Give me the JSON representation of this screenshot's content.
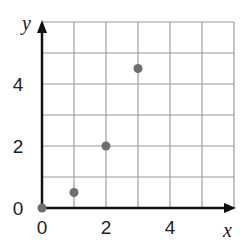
{
  "chart_data": {
    "type": "scatter",
    "title": "",
    "xlabel": "x",
    "ylabel": "y",
    "xlim": [
      0,
      6
    ],
    "ylim": [
      0,
      6
    ],
    "grid": true,
    "x_ticks": [
      "0",
      "2",
      "4"
    ],
    "y_ticks": [
      "0",
      "2",
      "4"
    ],
    "points": [
      {
        "x": 0,
        "y": 0
      },
      {
        "x": 1,
        "y": 0.5
      },
      {
        "x": 2,
        "y": 2
      },
      {
        "x": 3,
        "y": 4.5
      }
    ],
    "point_color": "#6e6e6e",
    "grid_color": "#9a9a9a",
    "axis_color": "#111111"
  }
}
